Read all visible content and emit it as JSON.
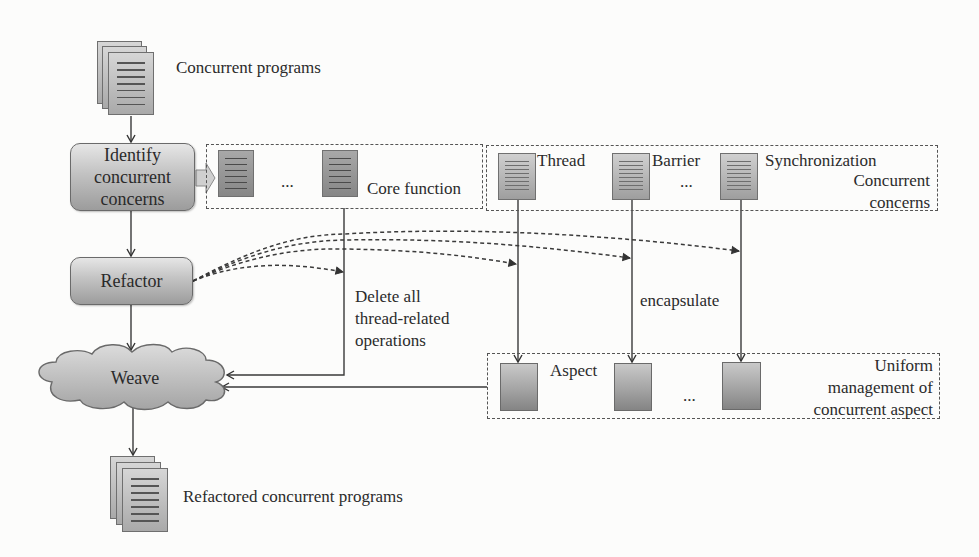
{
  "diagram": {
    "input": {
      "label": "Concurrent programs",
      "icon": "document-stack-icon"
    },
    "steps": [
      {
        "id": "identify",
        "label_lines": [
          "Identify",
          "concurrent",
          "concerns"
        ]
      },
      {
        "id": "refactor",
        "label": "Refactor"
      },
      {
        "id": "weave",
        "label": "Weave",
        "shape": "cloud"
      }
    ],
    "output": {
      "label": "Refactored concurrent programs",
      "icon": "document-stack-icon"
    },
    "core_group": {
      "ellipsis": "...",
      "label": "Core function"
    },
    "concerns_group": {
      "items": [
        "Thread",
        "Barrier",
        "Synchronization"
      ],
      "ellipsis": "...",
      "label_lines": [
        "Concurrent",
        "concerns"
      ]
    },
    "aspect_group": {
      "item_label": "Aspect",
      "ellipsis": "...",
      "label_lines": [
        "Uniform",
        "management of",
        "concurrent aspect"
      ]
    },
    "annotations": {
      "delete_lines": [
        "Delete all",
        "thread-related",
        "operations"
      ],
      "encapsulate": "encapsulate"
    },
    "colors": {
      "box_top": "#e6e6e6",
      "box_bottom": "#9c9c9c",
      "line": "#3a3a3a",
      "dashed_border": "#555555",
      "background": "#fcfcfb"
    }
  }
}
